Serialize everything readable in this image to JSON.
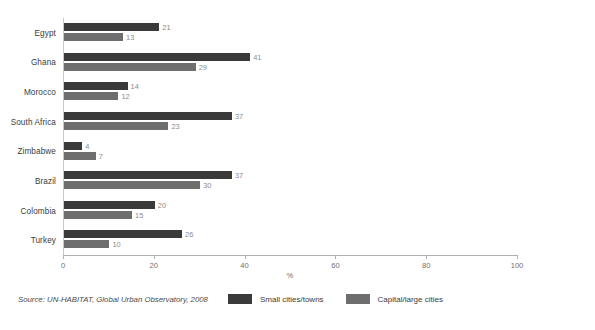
{
  "chart_data": {
    "type": "bar",
    "orientation": "horizontal",
    "title": "",
    "xlabel": "%",
    "ylabel": "",
    "xlim": [
      0,
      100
    ],
    "xticks": [
      0,
      20,
      40,
      60,
      80,
      100
    ],
    "grid": false,
    "legend_position": "bottom-right",
    "categories": [
      "Egypt",
      "Ghana",
      "Morocco",
      "South Africa",
      "Zimbabwe",
      "Brazil",
      "Colombia",
      "Turkey"
    ],
    "series": [
      {
        "name": "Small cities/towns",
        "color": "#3a3a3a",
        "values": [
          21,
          41,
          14,
          37,
          4,
          37,
          20,
          26
        ]
      },
      {
        "name": "Capital/large cities",
        "color": "#6e6e6e",
        "values": [
          13,
          29,
          12,
          23,
          7,
          30,
          15,
          10
        ]
      }
    ],
    "source": "Source: UN-HABITAT, Global Urban Observatory, 2008"
  },
  "axis": {
    "tick_labels": [
      "0",
      "20",
      "40",
      "60",
      "80",
      "100"
    ],
    "title": "%"
  },
  "legend": {
    "items": [
      {
        "label": "Small cities/towns",
        "color": "#3a3a3a"
      },
      {
        "label": "Capital/large cities",
        "color": "#6e6e6e"
      }
    ]
  },
  "footer": {
    "source": "Source: UN-HABITAT, Global Urban Observatory, 2008"
  }
}
